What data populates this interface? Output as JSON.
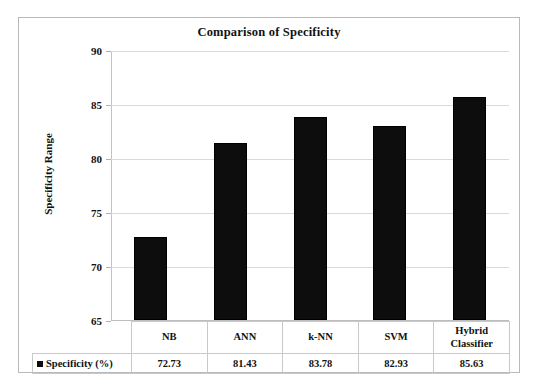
{
  "chart_data": {
    "type": "bar",
    "title": "Comparison of Specificity",
    "xlabel": "",
    "ylabel": "Specificity Range",
    "categories": [
      "NB",
      "ANN",
      "k-NN",
      "SVM",
      "Hybrid Classifier"
    ],
    "series": [
      {
        "name": "Specificity (%)",
        "values": [
          72.73,
          81.43,
          83.78,
          82.93,
          85.63
        ],
        "color": "#0d0d0d"
      }
    ],
    "ylim": [
      65,
      90
    ],
    "yticks": [
      65,
      70,
      75,
      80,
      85,
      90
    ],
    "ytick_labels": [
      "65",
      "70",
      "75",
      "80",
      "85",
      "90"
    ],
    "grid": true,
    "legend_position": "bottom-table",
    "value_labels": [
      "72.73",
      "81.43",
      "83.78",
      "82.93",
      "85.63"
    ]
  },
  "table": {
    "legend_label": "Specificity (%)",
    "category_labels": [
      [
        "NB"
      ],
      [
        "ANN"
      ],
      [
        "k-NN"
      ],
      [
        "SVM"
      ],
      [
        "Hybrid",
        "Classifier"
      ]
    ],
    "value_labels": [
      "72.73",
      "81.43",
      "83.78",
      "82.93",
      "85.63"
    ]
  }
}
